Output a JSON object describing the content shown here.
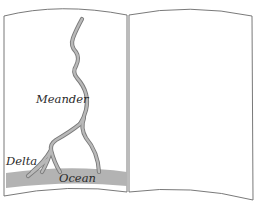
{
  "figure": {
    "labels": {
      "meander": "Meander",
      "delta": "Delta",
      "ocean": "Ocean"
    },
    "colors": {
      "page_fill": "#ffffff",
      "page_stroke": "#6a6a6a",
      "river_outline": "#7a7a7a",
      "river_fill": "#b9b9b9",
      "ocean": "#b3b3b3",
      "text": "#2a2a2a"
    }
  }
}
